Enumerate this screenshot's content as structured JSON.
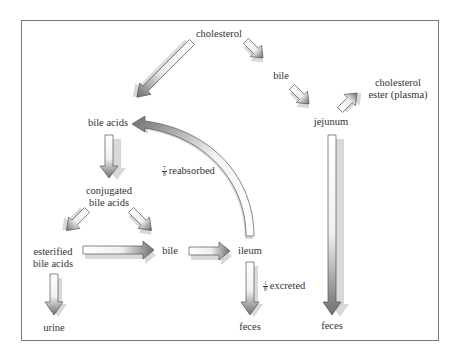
{
  "diagram": {
    "nodes": {
      "cholesterol": "cholesterol",
      "bile_top": "bile",
      "cholesterol_ester_line1": "cholesterol",
      "cholesterol_ester_line2": "ester (plasma)",
      "jejunum": "jejunum",
      "bile_acids": "bile acids",
      "conjugated_line1": "conjugated",
      "conjugated_line2": "bile acids",
      "esterified_line1": "esterified",
      "esterified_line2": "bile acids",
      "bile_mid": "bile",
      "ileum": "ileum",
      "urine": "urine",
      "feces_ileum": "feces",
      "feces_jejunum": "feces"
    },
    "annotations": {
      "reabsorbed": {
        "numerator": "7",
        "denominator": "8",
        "text": "reabsorbed"
      },
      "excreted": {
        "numerator": "1",
        "denominator": "8",
        "text": "excreted"
      }
    },
    "edges": [
      {
        "from": "cholesterol",
        "to": "bile acids"
      },
      {
        "from": "cholesterol",
        "to": "bile"
      },
      {
        "from": "bile",
        "to": "jejunum"
      },
      {
        "from": "jejunum",
        "to": "cholesterol ester (plasma)"
      },
      {
        "from": "jejunum",
        "to": "feces"
      },
      {
        "from": "bile acids",
        "to": "conjugated bile acids"
      },
      {
        "from": "conjugated bile acids",
        "to": "esterified bile acids"
      },
      {
        "from": "conjugated bile acids",
        "to": "bile"
      },
      {
        "from": "esterified bile acids",
        "to": "bile"
      },
      {
        "from": "bile",
        "to": "ileum"
      },
      {
        "from": "ileum",
        "to": "bile acids",
        "label": "7/8 reabsorbed"
      },
      {
        "from": "ileum",
        "to": "feces",
        "label": "1/8 excreted"
      },
      {
        "from": "esterified bile acids",
        "to": "urine"
      }
    ],
    "colors": {
      "arrow_light": "#ffffff",
      "arrow_dark": "#6e6e6e",
      "shadow": "#d4d4d4",
      "border": "#7a7a7a"
    }
  }
}
